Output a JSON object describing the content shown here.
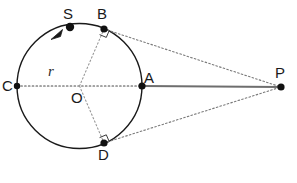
{
  "figure": {
    "type": "circle-tangent-geometry-diagram",
    "background_color": "#ffffff",
    "width": 297,
    "height": 183
  },
  "circle": {
    "name": "main-circle",
    "center_label": "O",
    "center_x": 79.5,
    "center_y": 86,
    "radius": 62.5,
    "stroke_color": "#1a1a1a",
    "stroke_width": 1.4,
    "fill": "none"
  },
  "labels": {
    "S": "S",
    "B": "B",
    "C": "C",
    "O": "O",
    "A": "A",
    "D": "D",
    "P": "P",
    "r": "r"
  },
  "points": [
    {
      "id": "S",
      "label": "S",
      "x": 70,
      "y": 27,
      "label_x": 63,
      "label_y": 6,
      "dot_radius": 4.2,
      "on_circle": true
    },
    {
      "id": "B",
      "label": "B",
      "x": 104,
      "y": 29,
      "label_x": 97,
      "label_y": 6,
      "dot_radius": 3.6,
      "on_circle": true
    },
    {
      "id": "C",
      "label": "C",
      "x": 17,
      "y": 86,
      "label_x": 2,
      "label_y": 78,
      "dot_radius": 3.2,
      "on_circle": true
    },
    {
      "id": "O",
      "label": "O",
      "x": 79.5,
      "y": 86,
      "label_x": 71,
      "label_y": 90,
      "dot_radius": 0,
      "on_circle": false
    },
    {
      "id": "A",
      "label": "A",
      "x": 142,
      "y": 86,
      "label_x": 144,
      "label_y": 70,
      "dot_radius": 3.6,
      "on_circle": true
    },
    {
      "id": "D",
      "label": "D",
      "x": 104,
      "y": 143,
      "label_x": 98,
      "label_y": 147,
      "dot_radius": 3.6,
      "on_circle": true
    },
    {
      "id": "P",
      "label": "P",
      "x": 281,
      "y": 87,
      "label_x": 275,
      "label_y": 65,
      "dot_radius": 3.6,
      "on_circle": false
    }
  ],
  "segments": [
    {
      "id": "C-O-A-diameter",
      "from": "C",
      "to": "A",
      "style": "dotted",
      "color": "#4a4a4a"
    },
    {
      "id": "O-B-radius",
      "from": "O",
      "to": "B",
      "style": "dotted",
      "color": "#9a9a9a"
    },
    {
      "id": "O-D-radius",
      "from": "O",
      "to": "D",
      "style": "dotted",
      "color": "#9a9a9a"
    },
    {
      "id": "A-P-secant",
      "from": "A",
      "to": "P",
      "style": "solid",
      "color": "#6e6e6e"
    },
    {
      "id": "B-P-tangent",
      "from": "B",
      "to": "P",
      "style": "dotted",
      "color": "#7a7a7a"
    },
    {
      "id": "D-P-tangent",
      "from": "D",
      "to": "P",
      "style": "dotted",
      "color": "#7a7a7a"
    }
  ],
  "right_angle_marks": [
    {
      "id": "right-angle-at-B",
      "at": "B",
      "size": 7
    },
    {
      "id": "right-angle-at-D",
      "at": "D",
      "size": 7
    }
  ],
  "direction_arrow": {
    "id": "counterclockwise-arrow-at-S",
    "description": "arrowhead on circle just counterclockwise of point S",
    "tip_x": 52,
    "tip_y": 38,
    "color": "#1a1a1a"
  },
  "colors": {
    "stroke": "#1a1a1a",
    "dotted_dark": "#4a4a4a",
    "dotted_light": "#9a9a9a",
    "solid_gray": "#6e6e6e",
    "text": "#1a1a1a",
    "background": "#ffffff"
  }
}
